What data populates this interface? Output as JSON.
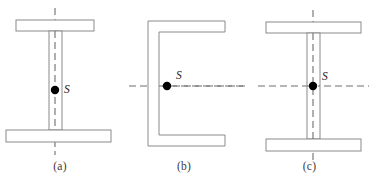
{
  "figure": {
    "background_color": "#ffffff",
    "outline_color": "#8a8a8a",
    "axis_color": "#6e6e6e",
    "marker_color": "#000000",
    "label_color": "#1a1a1a",
    "caption_color": "#3a3a3a",
    "width": 371,
    "height": 182
  },
  "panels": [
    {
      "id": "a",
      "caption": "(a)",
      "section_type": "unsymmetric-i-beam",
      "shear_center_label": "S",
      "axes": [
        "vertical"
      ],
      "shear_center": {
        "x": 55,
        "y": 90
      },
      "label_offset": {
        "dx": 9,
        "dy": -3
      },
      "geometry": {
        "top_flange": {
          "x": 16,
          "y": 20,
          "width": 78,
          "height": 11
        },
        "bottom_flange": {
          "x": 6,
          "y": 130,
          "width": 105,
          "height": 12
        },
        "web": {
          "x": 49,
          "y": 31,
          "width": 13,
          "height": 99
        },
        "axis_vertical": {
          "x": 55,
          "y1": 8,
          "y2": 155
        }
      }
    },
    {
      "id": "b",
      "caption": "(b)",
      "section_type": "channel",
      "shear_center_label": "S",
      "axes": [
        "horizontal"
      ],
      "shear_center": {
        "x": 167,
        "y": 86
      },
      "label_offset": {
        "dx": 9,
        "dy": -8
      },
      "geometry": {
        "outer": {
          "x": 148,
          "y": 21,
          "width": 77,
          "height": 125
        },
        "web_thickness": 11,
        "flange_thickness": 11,
        "opening_side": "right",
        "axis_horizontal": {
          "y": 86,
          "x1": 129,
          "x2": 245
        }
      }
    },
    {
      "id": "c",
      "caption": "(c)",
      "section_type": "symmetric-i-beam",
      "shear_center_label": "S",
      "axes": [
        "vertical",
        "horizontal"
      ],
      "shear_center": {
        "x": 313,
        "y": 86
      },
      "label_offset": {
        "dx": 9,
        "dy": -6
      },
      "geometry": {
        "top_flange": {
          "x": 266,
          "y": 22,
          "width": 95,
          "height": 11
        },
        "bottom_flange": {
          "x": 266,
          "y": 139,
          "width": 95,
          "height": 12
        },
        "web": {
          "x": 307,
          "y": 33,
          "width": 13,
          "height": 106
        },
        "axis_vertical": {
          "x": 313,
          "y1": 10,
          "y2": 160
        },
        "axis_horizontal": {
          "y": 86,
          "x1": 258,
          "x2": 369
        }
      }
    }
  ]
}
